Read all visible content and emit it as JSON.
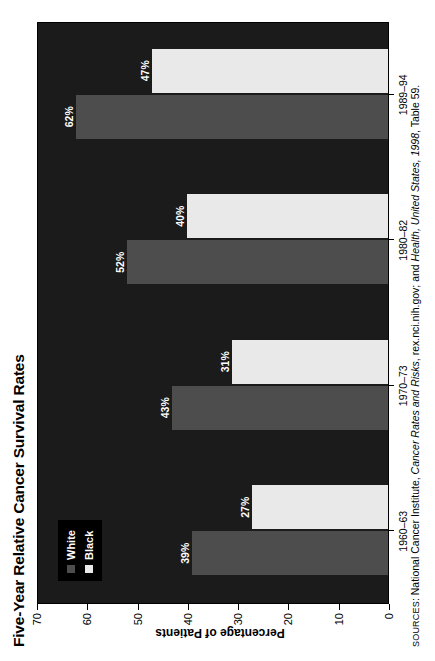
{
  "chart_data": {
    "type": "bar",
    "orientation": "vertical",
    "title": "Five-Year Relative Cancer Survival Rates",
    "xlabel": "",
    "ylabel": "Percentage of Patients",
    "ylim": [
      0,
      70
    ],
    "ytick_step": 10,
    "ytick_labels": [
      "0",
      "10",
      "20",
      "30",
      "40",
      "50",
      "60",
      "70"
    ],
    "grid": false,
    "legend_position": "upper-left-inside",
    "categories": [
      "1960–63",
      "1970–73",
      "1980–82",
      "1989–94"
    ],
    "series": [
      {
        "name": "White",
        "color": "#4d4d4d",
        "values": [
          39,
          43,
          52,
          62
        ],
        "labels": [
          "39%",
          "43%",
          "52%",
          "62%"
        ]
      },
      {
        "name": "Black",
        "color": "#e9e9e9",
        "values": [
          27,
          31,
          40,
          47
        ],
        "labels": [
          "27%",
          "31%",
          "40%",
          "47%"
        ]
      }
    ],
    "plot_background": "#1b1b1b",
    "label_color": "#ffffff"
  },
  "legend": {
    "items": [
      {
        "label": "White",
        "series": "white"
      },
      {
        "label": "Black",
        "series": "black"
      }
    ]
  },
  "source_note": {
    "prefix": "S",
    "prefix_smallcaps": "OURCES",
    "separator": ": ",
    "part1": "National Cancer Institute, ",
    "italic1": "Cancer Rates and Risks",
    "part2": ", rex.nci.nih.gov; and ",
    "italic2": "Health, United States, 1998",
    "part3": ", Table 59."
  }
}
